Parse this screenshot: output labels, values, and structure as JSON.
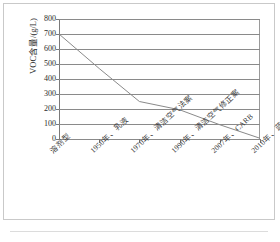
{
  "figure": {
    "background_color": "#ffffff",
    "line_color": "#8a8a8a",
    "grid_color": "#8a8a8a",
    "axis_color": "#7a7a7a"
  },
  "chart_data": {
    "type": "line",
    "title": "",
    "xlabel": "",
    "ylabel": "VOC含量/(g/L)",
    "ylim": [
      0,
      800
    ],
    "yticks": [
      0,
      100,
      200,
      300,
      400,
      500,
      600,
      700,
      800
    ],
    "ytick_labels": [
      "0",
      "100",
      "200",
      "300",
      "400",
      "500",
      "600",
      "700",
      "800"
    ],
    "grid": true,
    "grid_axis": "y",
    "legend": false,
    "legend_position": "none",
    "categories": [
      "溶剂型",
      "1950年、乳液",
      "1970年、清洁空气法案",
      "1990年、清洁空气修正案",
      "2007年、CARB",
      "2010年、蓝色天使"
    ],
    "values": [
      700,
      470,
      250,
      195,
      95,
      5
    ],
    "series": [
      {
        "name": "VOC含量",
        "values": [
          700,
          470,
          250,
          195,
          95,
          5
        ]
      }
    ]
  }
}
